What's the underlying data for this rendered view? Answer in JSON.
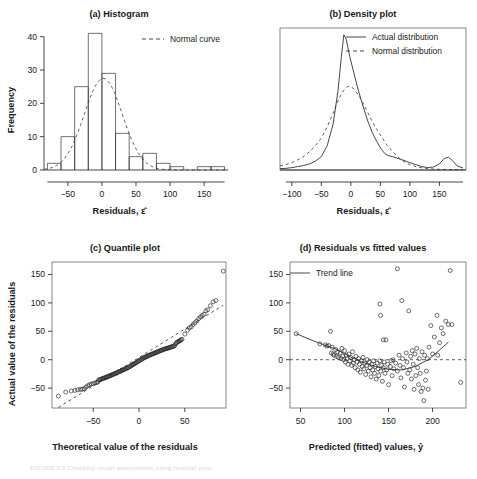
{
  "figure": {
    "caption": "FIGURE 8.5   Checking model assumptions using residual plots"
  },
  "chart_data": [
    {
      "type": "bar",
      "panel": "a",
      "title": "(a) Histogram",
      "xlabel": "Residuals, ε̂",
      "ylabel": "Frequency",
      "xlim": [
        -85,
        185
      ],
      "ylim": [
        0,
        42
      ],
      "xticks": [
        -50,
        0,
        50,
        100,
        150
      ],
      "yticks": [
        0,
        10,
        20,
        30,
        40
      ],
      "bin_width": 20,
      "bin_starts": [
        -80,
        -60,
        -40,
        -20,
        0,
        20,
        40,
        60,
        80,
        100,
        140,
        160
      ],
      "values": [
        2,
        10,
        25,
        41,
        29,
        11,
        4,
        5,
        2,
        1,
        1,
        1
      ],
      "legend": [
        {
          "label": "Normal curve",
          "style": "dashed"
        }
      ],
      "overlay": {
        "name": "normal-curve",
        "peak_value": 27.5,
        "mean": 2,
        "sd": 28
      },
      "grid": false
    },
    {
      "type": "line",
      "panel": "b",
      "title": "(b) Density plot",
      "xlabel": "Residuals, ε̂",
      "ylabel": "",
      "xlim": [
        -120,
        195
      ],
      "ylim": [
        0,
        1.05
      ],
      "xticks": [
        -100,
        -50,
        0,
        50,
        100,
        150
      ],
      "yticks": [],
      "legend_position": "top-right",
      "legend": [
        {
          "label": "Actual distribution",
          "style": "solid"
        },
        {
          "label": "Normal distribution",
          "style": "dashed"
        }
      ],
      "series": [
        {
          "name": "Actual distribution",
          "style": "solid",
          "peak_x": -12,
          "peak_y": 1.0,
          "secondary_bump_x": 160,
          "secondary_bump_y": 0.1,
          "x": [
            -120,
            -110,
            -100,
            -90,
            -80,
            -70,
            -60,
            -50,
            -40,
            -30,
            -22,
            -16,
            -12,
            -8,
            -2,
            5,
            12,
            20,
            28,
            36,
            44,
            52,
            58,
            64,
            70,
            80,
            90,
            100,
            110,
            120,
            130,
            140,
            150,
            158,
            165,
            172,
            180,
            190
          ],
          "y": [
            0.01,
            0.012,
            0.018,
            0.025,
            0.033,
            0.045,
            0.065,
            0.1,
            0.18,
            0.34,
            0.58,
            0.84,
            1.0,
            0.97,
            0.84,
            0.72,
            0.6,
            0.48,
            0.37,
            0.28,
            0.21,
            0.15,
            0.12,
            0.105,
            0.1,
            0.085,
            0.07,
            0.055,
            0.04,
            0.025,
            0.018,
            0.022,
            0.045,
            0.085,
            0.095,
            0.07,
            0.03,
            0.015
          ]
        },
        {
          "name": "Normal distribution",
          "style": "dashed",
          "peak_x": -2,
          "peak_y": 0.62,
          "x": [
            -120,
            -110,
            -100,
            -90,
            -80,
            -70,
            -60,
            -50,
            -40,
            -30,
            -20,
            -12,
            -6,
            -2,
            4,
            12,
            20,
            28,
            36,
            44,
            52,
            60,
            70,
            80,
            90,
            100,
            110,
            120,
            130,
            140,
            150,
            160,
            170,
            180,
            190
          ],
          "y": [
            0.03,
            0.04,
            0.055,
            0.075,
            0.1,
            0.135,
            0.18,
            0.235,
            0.32,
            0.42,
            0.53,
            0.59,
            0.615,
            0.62,
            0.605,
            0.56,
            0.5,
            0.43,
            0.36,
            0.3,
            0.245,
            0.19,
            0.14,
            0.095,
            0.062,
            0.04,
            0.025,
            0.016,
            0.01,
            0.007,
            0.005,
            0.004,
            0.003,
            0.002,
            0.002
          ]
        }
      ],
      "grid": false
    },
    {
      "type": "scatter",
      "panel": "c",
      "title": "(c) Quantile plot",
      "xlabel": "Theoretical value of the residuals",
      "ylabel": "Actual value of the residuals",
      "xlim": [
        -95,
        95
      ],
      "ylim": [
        -85,
        172
      ],
      "xticks": [
        -50,
        0,
        50
      ],
      "yticks": [
        -50,
        0,
        50,
        100,
        150
      ],
      "marker": "open-circle",
      "reference_line": {
        "style": "dashed",
        "x": [
          -88,
          92
        ],
        "y": [
          -84,
          96
        ]
      },
      "points": [
        [
          -88,
          -64
        ],
        [
          -80,
          -57
        ],
        [
          -74,
          -55
        ],
        [
          -70,
          -54
        ],
        [
          -67,
          -53
        ],
        [
          -64,
          -52
        ],
        [
          -62,
          -52
        ],
        [
          -60,
          -51
        ],
        [
          -58,
          -48
        ],
        [
          -56,
          -46
        ],
        [
          -54,
          -44
        ],
        [
          -52,
          -43
        ],
        [
          -50,
          -42
        ],
        [
          -48,
          -41
        ],
        [
          -46,
          -40
        ],
        [
          -45,
          -39
        ],
        [
          -44,
          -36
        ],
        [
          -43,
          -35
        ],
        [
          -42,
          -35
        ],
        [
          -41,
          -34
        ],
        [
          -40,
          -33
        ],
        [
          -39,
          -33
        ],
        [
          -38,
          -32
        ],
        [
          -37,
          -32
        ],
        [
          -36,
          -31
        ],
        [
          -35,
          -30
        ],
        [
          -34,
          -30
        ],
        [
          -33,
          -29
        ],
        [
          -32,
          -28
        ],
        [
          -31,
          -28
        ],
        [
          -30,
          -27
        ],
        [
          -29,
          -26
        ],
        [
          -28,
          -26
        ],
        [
          -27,
          -25
        ],
        [
          -26,
          -24
        ],
        [
          -25,
          -24
        ],
        [
          -24,
          -23
        ],
        [
          -23,
          -22
        ],
        [
          -22,
          -21
        ],
        [
          -21,
          -21
        ],
        [
          -20,
          -20
        ],
        [
          -19,
          -19
        ],
        [
          -18,
          -18
        ],
        [
          -17,
          -18
        ],
        [
          -16,
          -17
        ],
        [
          -15,
          -16
        ],
        [
          -14,
          -15
        ],
        [
          -13,
          -15
        ],
        [
          -12,
          -14
        ],
        [
          -11,
          -13
        ],
        [
          -10,
          -12
        ],
        [
          -9,
          -11
        ],
        [
          -8,
          -10
        ],
        [
          -7,
          -9
        ],
        [
          -6,
          -8
        ],
        [
          -5,
          -7
        ],
        [
          -4,
          -6
        ],
        [
          -3,
          -5
        ],
        [
          -2,
          -4
        ],
        [
          -1,
          -3
        ],
        [
          0,
          -2
        ],
        [
          1,
          -1
        ],
        [
          2,
          0
        ],
        [
          3,
          1
        ],
        [
          4,
          2
        ],
        [
          5,
          3
        ],
        [
          6,
          4
        ],
        [
          7,
          5
        ],
        [
          8,
          5
        ],
        [
          9,
          6
        ],
        [
          10,
          7
        ],
        [
          11,
          8
        ],
        [
          12,
          8
        ],
        [
          13,
          9
        ],
        [
          14,
          10
        ],
        [
          15,
          10
        ],
        [
          16,
          11
        ],
        [
          17,
          12
        ],
        [
          18,
          12
        ],
        [
          19,
          13
        ],
        [
          20,
          14
        ],
        [
          21,
          14
        ],
        [
          22,
          15
        ],
        [
          23,
          16
        ],
        [
          24,
          16
        ],
        [
          25,
          17
        ],
        [
          26,
          18
        ],
        [
          27,
          18
        ],
        [
          28,
          19
        ],
        [
          29,
          19
        ],
        [
          30,
          20
        ],
        [
          31,
          20
        ],
        [
          32,
          21
        ],
        [
          33,
          21
        ],
        [
          34,
          22
        ],
        [
          35,
          22
        ],
        [
          36,
          23
        ],
        [
          37,
          23
        ],
        [
          38,
          24
        ],
        [
          39,
          25
        ],
        [
          40,
          28
        ],
        [
          41,
          30
        ],
        [
          42,
          31
        ],
        [
          43,
          32
        ],
        [
          44,
          33
        ],
        [
          45,
          34
        ],
        [
          46,
          35
        ],
        [
          47,
          36
        ],
        [
          50,
          45
        ],
        [
          53,
          52
        ],
        [
          55,
          56
        ],
        [
          57,
          58
        ],
        [
          59,
          62
        ],
        [
          61,
          65
        ],
        [
          63,
          68
        ],
        [
          65,
          72
        ],
        [
          67,
          75
        ],
        [
          69,
          78
        ],
        [
          71,
          80
        ],
        [
          73,
          86
        ],
        [
          75,
          88
        ],
        [
          78,
          95
        ],
        [
          81,
          102
        ],
        [
          84,
          104
        ],
        [
          92,
          156
        ]
      ],
      "grid": false
    },
    {
      "type": "scatter",
      "panel": "d",
      "title": "(d) Residuals vs fitted values",
      "xlabel": "Predicted (fitted) values, ŷ",
      "ylabel": "",
      "xlim": [
        38,
        238
      ],
      "ylim": [
        -85,
        172
      ],
      "xticks": [
        50,
        100,
        150,
        200
      ],
      "yticks": [
        -50,
        0,
        50,
        100,
        150
      ],
      "marker": "open-circle",
      "legend": [
        {
          "label": "Trend line",
          "style": "solid"
        }
      ],
      "zero_line": {
        "style": "dashed",
        "y": 0
      },
      "trend_line": {
        "style": "solid",
        "x": [
          45,
          60,
          75,
          90,
          105,
          120,
          135,
          150,
          165,
          180,
          195,
          210,
          218
        ],
        "y": [
          46,
          36,
          27,
          19,
          6,
          -4,
          -12,
          -17,
          -18,
          -12,
          0,
          20,
          31
        ]
      },
      "points": [
        [
          45,
          46
        ],
        [
          72,
          28
        ],
        [
          78,
          26
        ],
        [
          80,
          24
        ],
        [
          82,
          25
        ],
        [
          84,
          50
        ],
        [
          85,
          12
        ],
        [
          86,
          22
        ],
        [
          87,
          10
        ],
        [
          88,
          8
        ],
        [
          90,
          18
        ],
        [
          91,
          6
        ],
        [
          92,
          14
        ],
        [
          93,
          4
        ],
        [
          95,
          12
        ],
        [
          96,
          2
        ],
        [
          97,
          20
        ],
        [
          98,
          6
        ],
        [
          99,
          0
        ],
        [
          100,
          16
        ],
        [
          101,
          -4
        ],
        [
          102,
          8
        ],
        [
          103,
          2
        ],
        [
          104,
          -8
        ],
        [
          105,
          10
        ],
        [
          106,
          -2
        ],
        [
          107,
          4
        ],
        [
          108,
          -10
        ],
        [
          109,
          14
        ],
        [
          110,
          -6
        ],
        [
          111,
          0
        ],
        [
          112,
          -14
        ],
        [
          113,
          6
        ],
        [
          114,
          -4
        ],
        [
          115,
          -18
        ],
        [
          116,
          2
        ],
        [
          117,
          -8
        ],
        [
          118,
          -22
        ],
        [
          119,
          -2
        ],
        [
          120,
          -12
        ],
        [
          121,
          4
        ],
        [
          122,
          -16
        ],
        [
          123,
          -6
        ],
        [
          124,
          -26
        ],
        [
          125,
          -10
        ],
        [
          126,
          0
        ],
        [
          127,
          -20
        ],
        [
          128,
          -4
        ],
        [
          129,
          -14
        ],
        [
          130,
          -30
        ],
        [
          131,
          -8
        ],
        [
          132,
          -18
        ],
        [
          133,
          -2
        ],
        [
          134,
          -24
        ],
        [
          135,
          -12
        ],
        [
          136,
          -34
        ],
        [
          137,
          -6
        ],
        [
          138,
          -16
        ],
        [
          139,
          -28
        ],
        [
          140,
          98
        ],
        [
          140,
          -2
        ],
        [
          141,
          78
        ],
        [
          141,
          -20
        ],
        [
          142,
          -10
        ],
        [
          143,
          -38
        ],
        [
          144,
          35
        ],
        [
          144,
          -14
        ],
        [
          145,
          -4
        ],
        [
          146,
          -24
        ],
        [
          147,
          35
        ],
        [
          148,
          -18
        ],
        [
          149,
          -8
        ],
        [
          150,
          -44
        ],
        [
          152,
          -12
        ],
        [
          153,
          -2
        ],
        [
          154,
          -28
        ],
        [
          155,
          0
        ],
        [
          156,
          -16
        ],
        [
          158,
          -6
        ],
        [
          160,
          160
        ],
        [
          160,
          -20
        ],
        [
          162,
          8
        ],
        [
          163,
          -10
        ],
        [
          164,
          -32
        ],
        [
          165,
          104
        ],
        [
          166,
          2
        ],
        [
          167,
          -14
        ],
        [
          168,
          -48
        ],
        [
          170,
          12
        ],
        [
          171,
          -4
        ],
        [
          172,
          -24
        ],
        [
          173,
          86
        ],
        [
          174,
          -18
        ],
        [
          175,
          6
        ],
        [
          176,
          -34
        ],
        [
          177,
          16
        ],
        [
          178,
          -8
        ],
        [
          179,
          -52
        ],
        [
          180,
          10
        ],
        [
          181,
          -28
        ],
        [
          182,
          20
        ],
        [
          183,
          -14
        ],
        [
          184,
          -44
        ],
        [
          185,
          2
        ],
        [
          186,
          -24
        ],
        [
          187,
          -56
        ],
        [
          188,
          14
        ],
        [
          189,
          -50
        ],
        [
          190,
          -72
        ],
        [
          191,
          8
        ],
        [
          192,
          -36
        ],
        [
          193,
          -20
        ],
        [
          194,
          2
        ],
        [
          195,
          -52
        ],
        [
          196,
          22
        ],
        [
          198,
          60
        ],
        [
          200,
          10
        ],
        [
          202,
          40
        ],
        [
          205,
          78
        ],
        [
          206,
          8
        ],
        [
          208,
          30
        ],
        [
          210,
          56
        ],
        [
          212,
          46
        ],
        [
          215,
          68
        ],
        [
          218,
          62
        ],
        [
          220,
          157
        ],
        [
          222,
          62
        ],
        [
          232,
          -40
        ]
      ],
      "grid": false
    }
  ]
}
